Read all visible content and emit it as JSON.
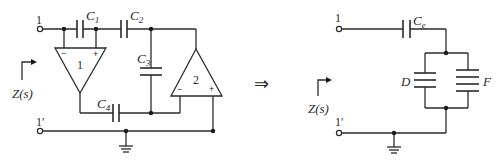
{
  "left_circuit": {
    "terminal_top": "1",
    "terminal_bottom": "1′",
    "impedance_label": "Z(s)",
    "capacitors": [
      {
        "name": "C",
        "sub": "1"
      },
      {
        "name": "C",
        "sub": "2"
      },
      {
        "name": "C",
        "sub": "3"
      },
      {
        "name": "C",
        "sub": "4"
      }
    ],
    "opamps": [
      {
        "label": "1",
        "minus": "−",
        "plus": "+"
      },
      {
        "label": "2",
        "minus": "−",
        "plus": "+"
      }
    ]
  },
  "arrow": "⇒",
  "right_circuit": {
    "terminal_top": "1",
    "terminal_bottom": "1′",
    "impedance_label": "Z(s)",
    "series_cap": {
      "name": "C",
      "sub": "e"
    },
    "element_d": "D",
    "element_f": "F"
  }
}
